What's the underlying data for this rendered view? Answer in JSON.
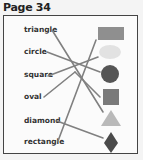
{
  "page": {
    "title": "Page 34"
  },
  "labels": [
    {
      "text": "triangle",
      "x": 24,
      "y": 25
    },
    {
      "text": "circle",
      "x": 24,
      "y": 47
    },
    {
      "text": "square",
      "x": 24,
      "y": 70
    },
    {
      "text": "oval",
      "x": 24,
      "y": 92
    },
    {
      "text": "diamond",
      "x": 24,
      "y": 116
    },
    {
      "text": "rectangle",
      "x": 24,
      "y": 137
    }
  ],
  "shapes": [
    {
      "name": "rectangle",
      "color": "#8f8f8f"
    },
    {
      "name": "oval",
      "color": "#e2e2e2"
    },
    {
      "name": "circle",
      "color": "#555555"
    },
    {
      "name": "square",
      "color": "#7a7a7a"
    },
    {
      "name": "triangle",
      "color": "#b9b9b9"
    },
    {
      "name": "diamond",
      "color": "#4a4a4a"
    }
  ],
  "lines_color": "#808080"
}
